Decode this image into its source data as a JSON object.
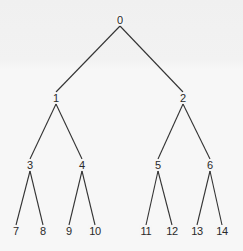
{
  "diagram": {
    "type": "binary-tree",
    "colors": {
      "background": "#f5f5f5",
      "edge": "#333333",
      "text": "#2a2a2a"
    },
    "nodes": [
      {
        "id": "0",
        "label": "0",
        "x": 120,
        "y": 20
      },
      {
        "id": "1",
        "label": "1",
        "x": 56,
        "y": 98
      },
      {
        "id": "2",
        "label": "2",
        "x": 183,
        "y": 98
      },
      {
        "id": "3",
        "label": "3",
        "x": 30,
        "y": 165
      },
      {
        "id": "4",
        "label": "4",
        "x": 82,
        "y": 165
      },
      {
        "id": "5",
        "label": "5",
        "x": 158,
        "y": 165
      },
      {
        "id": "6",
        "label": "6",
        "x": 210,
        "y": 165
      },
      {
        "id": "7",
        "label": "7",
        "x": 16,
        "y": 231
      },
      {
        "id": "8",
        "label": "8",
        "x": 43,
        "y": 231
      },
      {
        "id": "9",
        "label": "9",
        "x": 69,
        "y": 231
      },
      {
        "id": "10",
        "label": "10",
        "x": 95,
        "y": 231
      },
      {
        "id": "11",
        "label": "11",
        "x": 146,
        "y": 231
      },
      {
        "id": "12",
        "label": "12",
        "x": 172,
        "y": 231
      },
      {
        "id": "13",
        "label": "13",
        "x": 197,
        "y": 231
      },
      {
        "id": "14",
        "label": "14",
        "x": 222,
        "y": 231
      }
    ],
    "edges": [
      [
        "0",
        "1"
      ],
      [
        "0",
        "2"
      ],
      [
        "1",
        "3"
      ],
      [
        "1",
        "4"
      ],
      [
        "2",
        "5"
      ],
      [
        "2",
        "6"
      ],
      [
        "3",
        "7"
      ],
      [
        "3",
        "8"
      ],
      [
        "4",
        "9"
      ],
      [
        "4",
        "10"
      ],
      [
        "5",
        "11"
      ],
      [
        "5",
        "12"
      ],
      [
        "6",
        "13"
      ],
      [
        "6",
        "14"
      ]
    ]
  }
}
